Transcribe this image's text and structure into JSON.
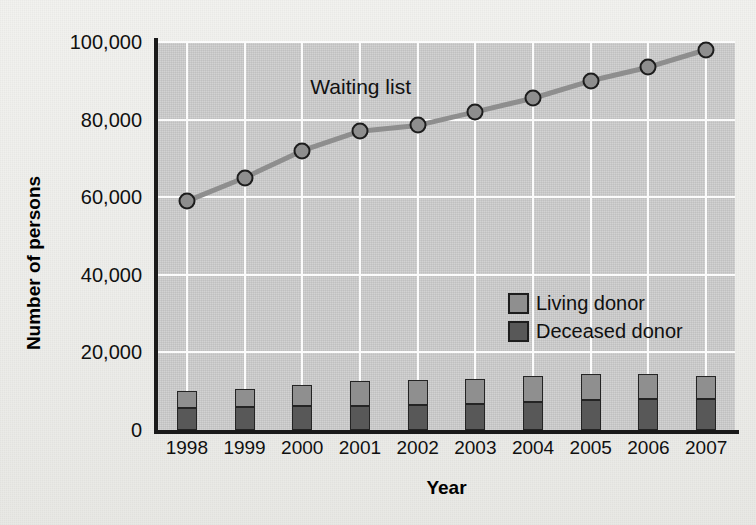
{
  "chart_data": {
    "type": "bar",
    "title": "",
    "xlabel": "Year",
    "ylabel": "Number of persons",
    "categories": [
      "1998",
      "1999",
      "2000",
      "2001",
      "2002",
      "2003",
      "2004",
      "2005",
      "2006",
      "2007"
    ],
    "ylim": [
      0,
      100000
    ],
    "yticks": [
      0,
      20000,
      40000,
      60000,
      80000,
      100000
    ],
    "ytick_labels": [
      "0",
      "20,000",
      "40,000",
      "60,000",
      "80,000",
      "100,000"
    ],
    "grid": true,
    "legend_position": "center-right",
    "annotations": [
      {
        "text": "Waiting list",
        "x": "2000",
        "y": 88000
      }
    ],
    "series": [
      {
        "name": "Living donor",
        "type": "bar",
        "stacked": true,
        "color": "#8f8f8f",
        "values": [
          4300,
          4600,
          5500,
          6300,
          6400,
          6500,
          6800,
          6700,
          6400,
          6000
        ]
      },
      {
        "name": "Deceased donor",
        "type": "bar",
        "stacked": true,
        "color": "#585858",
        "values": [
          5800,
          5900,
          6100,
          6300,
          6400,
          6700,
          7200,
          7800,
          8000,
          8000
        ]
      },
      {
        "name": "Waiting list",
        "type": "line",
        "color": "#8e8e8e",
        "marker": "circle",
        "values": [
          59000,
          65000,
          72000,
          77000,
          78500,
          82000,
          85500,
          90000,
          93500,
          98000
        ]
      }
    ]
  },
  "legend": {
    "items": [
      {
        "label": "Living donor",
        "color": "#8f8f8f"
      },
      {
        "label": "Deceased donor",
        "color": "#585858"
      }
    ]
  },
  "colors": {
    "plot_background": "#c8c8c8",
    "page_background": "#efefec",
    "gridline": "#fbfbfb",
    "axis": "#1a1a1a",
    "living_donor": "#8f8f8f",
    "deceased_donor": "#585858",
    "waiting_list_line": "#8e8e8e"
  }
}
